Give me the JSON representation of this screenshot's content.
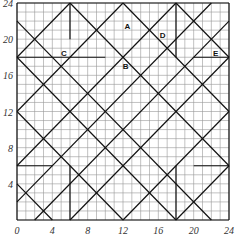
{
  "diagram": {
    "grid": {
      "min": 0,
      "max": 24,
      "step": 1
    },
    "x_ticks": [
      "0",
      "4",
      "8",
      "12",
      "16",
      "20",
      "24"
    ],
    "y_ticks": [
      "4",
      "8",
      "12",
      "16",
      "20",
      "24"
    ],
    "regions": [
      {
        "label": "A",
        "x": 12.5,
        "y": 21.5
      },
      {
        "label": "B",
        "x": 12.3,
        "y": 17.0
      },
      {
        "label": "C",
        "x": 5.3,
        "y": 18.5
      },
      {
        "label": "D",
        "x": 16.5,
        "y": 20.5
      },
      {
        "label": "E",
        "x": 22.5,
        "y": 18.5
      }
    ],
    "colors": {
      "grid": "#999999",
      "lines": "#111111"
    }
  }
}
